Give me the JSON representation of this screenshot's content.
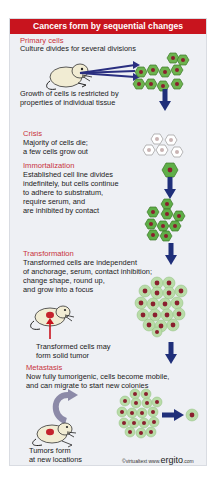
{
  "title": "Cancers form by sequential changes",
  "stages": {
    "primary": {
      "heading": "Primary cells",
      "line1": "Culture divides for several divisions",
      "note1": "Growth of cells is restricted by",
      "note2": "properties of individual tissue"
    },
    "crisis": {
      "heading": "Crisis",
      "line1": "Majority of cells die;",
      "line2": "a few cells grow out"
    },
    "immortalization": {
      "heading": "Immortalization",
      "line1": "Established cell line divides",
      "line2": "indefinitely, but cells continue",
      "line3": "to adhere to substratum,",
      "line4": "require serum, and",
      "line5": "are inhibited by contact"
    },
    "transformation": {
      "heading": "Transformation",
      "line1": "Transformed cells are independent",
      "line2": "of anchorage, serum, contact inhibition;",
      "line3": "change shape, round up,",
      "line4": "and grow into a focus",
      "tumor1": "Transformed cells may",
      "tumor2": "form solid tumor"
    },
    "metastasis": {
      "heading": "Metastasis",
      "line1": "Now fully tumorigenic, cells become mobile,",
      "line2": "and can migrate to start new colonies",
      "tumor1": "Tumors form",
      "tumor2": "at new locations"
    }
  },
  "credit": {
    "copyright": "©virtualtext",
    "www": "www.",
    "brand": "ergito",
    "tld": ".com"
  },
  "colors": {
    "header": "#c8141e",
    "heading_text": "#c8323c",
    "arrow": "#1f2f7a",
    "cell_green": "#5fae48",
    "cell_pale": "#b9dca8",
    "nucleus": "#8a1f2e"
  }
}
